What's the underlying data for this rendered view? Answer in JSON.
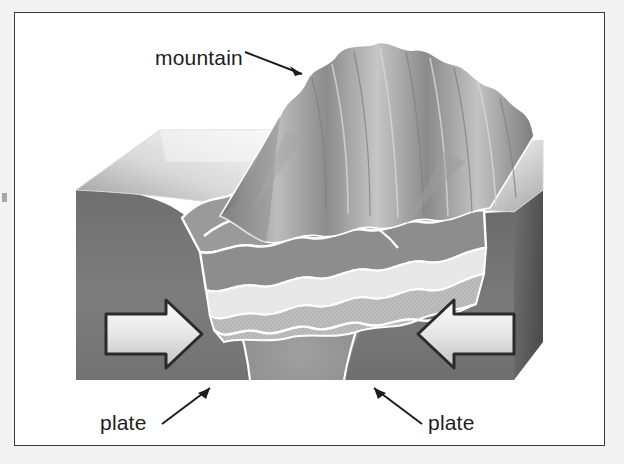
{
  "page": {
    "background_color": "#f3f3f3",
    "plate_color": "#ffffff",
    "frame_border_color": "#3a3a3a"
  },
  "figure": {
    "type": "geology-block-diagram",
    "palette": {
      "rock_dark": "#6d6d6d",
      "rock_mid": "#8a8a8a",
      "rock_light": "#c9c9c9",
      "highlight": "#f4f4f4",
      "outline_white": "#ffffff",
      "outline_dark": "#1d1d1d",
      "core_light": "#bdbdbd",
      "mantle": "#7b7b7b"
    },
    "labels": [
      {
        "id": "mountain",
        "text": "mountain",
        "x": 141,
        "y": 45,
        "anchor": "start",
        "leader_from": [
          228,
          40
        ],
        "leader_to": [
          290,
          62
        ]
      },
      {
        "id": "plate-left",
        "text": "plate",
        "x": 86,
        "y": 418,
        "anchor": "start",
        "leader_from": [
          152,
          410
        ],
        "leader_to": [
          196,
          375
        ]
      },
      {
        "id": "plate-right",
        "text": "plate",
        "x": 414,
        "y": 418,
        "anchor": "start",
        "leader_from": [
          408,
          410
        ],
        "leader_to": [
          363,
          375
        ]
      }
    ],
    "arrows": [
      {
        "id": "force-arrow-left",
        "direction": "right",
        "cx": 138,
        "cy": 322,
        "length": 96,
        "meaning": "compression-force"
      },
      {
        "id": "force-arrow-right",
        "direction": "left",
        "cx": 452,
        "cy": 322,
        "length": 96,
        "meaning": "compression-force"
      }
    ],
    "features": [
      {
        "id": "mountain-range",
        "description": "corrugated folded peaks along the collision zone"
      },
      {
        "id": "left-plate",
        "description": "crustal block sliding right"
      },
      {
        "id": "right-plate",
        "description": "crustal block sliding left"
      },
      {
        "id": "fold-layers",
        "description": "nested banded strata folded upward"
      },
      {
        "id": "root-zone",
        "description": "downward crustal root beneath the range"
      }
    ]
  }
}
